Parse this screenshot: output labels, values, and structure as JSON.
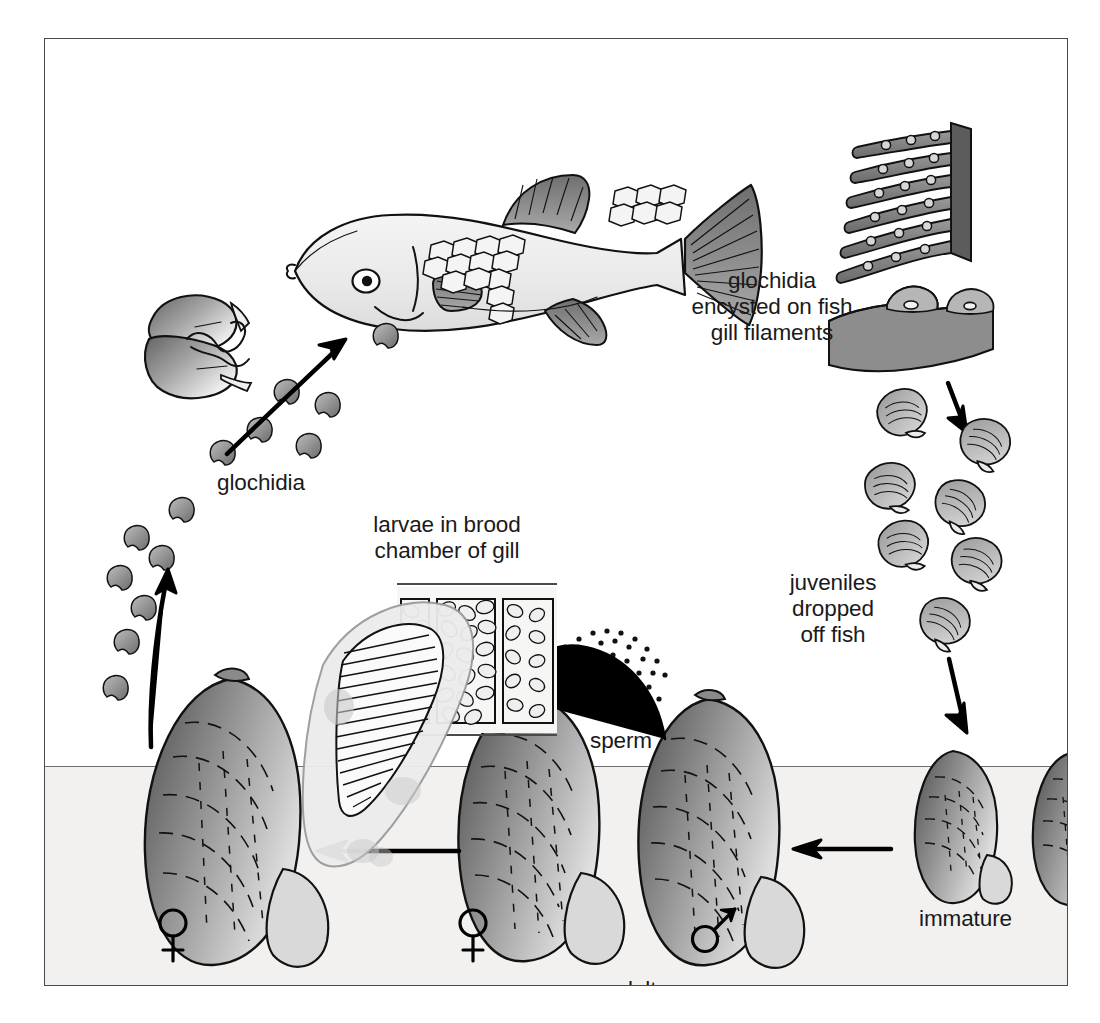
{
  "figure": {
    "kind": "life-cycle-diagram",
    "background_color": "#ffffff",
    "frame_color": "#4a4a4a",
    "substrate_color": "#f2f1ef",
    "ink_color": "#111111"
  },
  "labels": {
    "glochidia": "glochidia",
    "glochidia_encysted": "glochidia\nencysted on fish\ngill filaments",
    "larvae_brood": "larvae in brood\nchamber of gill",
    "juveniles_dropped": "juveniles\ndropped\noff fish",
    "immature": "immature",
    "sperm": "sperm",
    "adults": "adults",
    "female_symbol_left": "♀",
    "female_symbol_center": "♀",
    "male_symbol": "♂"
  },
  "stages": [
    {
      "id": "adults",
      "label": "adults",
      "note": "two adult mussels in substrate, one female one male"
    },
    {
      "id": "sperm",
      "label": "sperm",
      "note": "sperm cloud released by male, drawn to female"
    },
    {
      "id": "larvae-brood",
      "label": "larvae in brood chamber of gill",
      "note": "cutaway of gill brood chamber packed with larvae"
    },
    {
      "id": "glochidia",
      "label": "glochidia",
      "note": "glochidia larvae released into water column"
    },
    {
      "id": "glochidia-encysted",
      "label": "glochidia encysted on fish gill filaments",
      "note": "glochidia attach to host fish gill filaments"
    },
    {
      "id": "juveniles",
      "label": "juveniles dropped off fish",
      "note": "juvenile mussels fall from fish"
    },
    {
      "id": "immature",
      "label": "immature",
      "note": "immature mussels settle on substrate"
    }
  ],
  "arrows": [
    {
      "id": "glochidia-to-fish",
      "direction": "up-right",
      "from": "glochidia cloud",
      "to": "host fish mouth"
    },
    {
      "id": "female-to-glochidia",
      "direction": "up",
      "from": "female mussel",
      "to": "glochidia cloud"
    },
    {
      "id": "gill-to-juveniles",
      "direction": "down",
      "from": "gill filaments",
      "to": "juveniles"
    },
    {
      "id": "juveniles-to-immature",
      "direction": "down",
      "from": "juveniles",
      "to": "immature"
    },
    {
      "id": "immature-to-adults",
      "direction": "left",
      "from": "immature",
      "to": "adults"
    },
    {
      "id": "adults-to-female",
      "direction": "left",
      "from": "adults",
      "to": "female mussel"
    },
    {
      "id": "sperm-arc",
      "direction": "left-arc",
      "from": "male mussel",
      "to": "female mussel"
    }
  ],
  "counts": {
    "glochidia_particles": 14,
    "juvenile_shells": 7,
    "immature_mussels": 2,
    "adult_mussels": 2,
    "gill_filaments": 6
  }
}
